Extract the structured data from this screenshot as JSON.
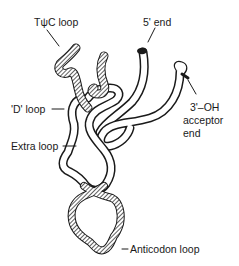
{
  "diagram": {
    "labels": {
      "tpsic_loop": "TψC loop",
      "five_end": "5' end",
      "three_oh_line1": "3'–OH",
      "three_oh_line2": "acceptor",
      "three_oh_line3": "end",
      "d_loop": "'D' loop",
      "extra_loop": "Extra loop",
      "anticodon_loop": "Anticodon loop"
    },
    "colors": {
      "stroke": "#1a1a1a",
      "fill": "#ffffff",
      "hatch": "#1a1a1a"
    }
  }
}
